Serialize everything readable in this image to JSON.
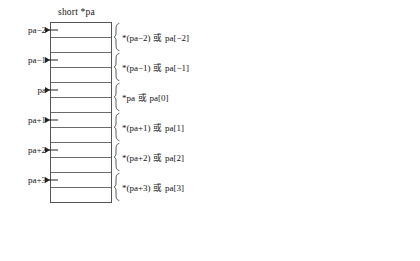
{
  "figure": {
    "kind": "pointer-arithmetic-memory-diagram",
    "panels": [
      {
        "id": "short",
        "title": "short *pa",
        "table": {
          "rows": 12,
          "bytes_per_element": 2,
          "cell_height_px": 15
        },
        "entries": [
          {
            "pointer_label": "pa−2",
            "annotation_prefix": "*(pa−2)",
            "annotation_conjunction": "或",
            "annotation_suffix": "pa[−2]",
            "start_row": 0,
            "span_rows": 2
          },
          {
            "pointer_label": "pa−1",
            "annotation_prefix": "*(pa−1)",
            "annotation_conjunction": "或",
            "annotation_suffix": "pa[−1]",
            "start_row": 2,
            "span_rows": 2
          },
          {
            "pointer_label": "pa",
            "annotation_prefix": "*pa",
            "annotation_conjunction": "或",
            "annotation_suffix": "pa[0]",
            "start_row": 4,
            "span_rows": 2
          },
          {
            "pointer_label": "pa+1",
            "annotation_prefix": "*(pa+1)",
            "annotation_conjunction": "或",
            "annotation_suffix": "pa[1]",
            "start_row": 6,
            "span_rows": 2
          },
          {
            "pointer_label": "pa+2",
            "annotation_prefix": "*(pa+2)",
            "annotation_conjunction": "或",
            "annotation_suffix": "pa[2]",
            "start_row": 8,
            "span_rows": 2
          },
          {
            "pointer_label": "pa+3",
            "annotation_prefix": "*(pa+3)",
            "annotation_conjunction": "或",
            "annotation_suffix": "pa[3]",
            "start_row": 10,
            "span_rows": 2
          }
        ]
      },
      {
        "id": "long",
        "title": "long *pb",
        "table": {
          "rows": 16,
          "bytes_per_element": 4,
          "cell_height_px": 14
        },
        "entries": [
          {
            "pointer_label": "pb−1",
            "annotation_prefix": "*(pb−1)",
            "annotation_conjunction": "或",
            "annotation_suffix": "pb[−1]",
            "start_row": 0,
            "span_rows": 4
          },
          {
            "pointer_label": "pb",
            "annotation_prefix": "*pb",
            "annotation_conjunction": "或",
            "annotation_suffix": "pb[0]",
            "start_row": 4,
            "span_rows": 4
          },
          {
            "pointer_label": "pb+1",
            "annotation_prefix": "*(pb+1)",
            "annotation_conjunction": "或",
            "annotation_suffix": "pb[1]",
            "start_row": 8,
            "span_rows": 4
          },
          {
            "pointer_label": "pb+2",
            "annotation_prefix": "*(pb+2)",
            "annotation_conjunction": "或",
            "annotation_suffix": "pb[2]",
            "start_row": 12,
            "span_rows": 4
          }
        ]
      }
    ],
    "colors": {
      "stroke": "#555555",
      "cell_divider": "#6a6a6a",
      "text": "#151515",
      "background": "#ffffff"
    }
  }
}
